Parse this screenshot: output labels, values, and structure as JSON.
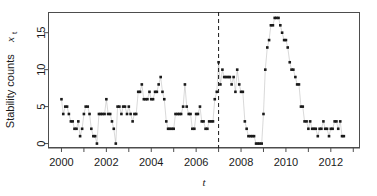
{
  "chart_data": {
    "type": "scatter",
    "title": "",
    "subtitle": "",
    "xlabel": "t",
    "ylabel": "Stability counts",
    "ylabel_sub": "t",
    "ylabel_var": "x",
    "xlim": [
      1999.4,
      2013.3
    ],
    "ylim": [
      -0.6,
      17.8
    ],
    "yticks": [
      0,
      5,
      10,
      15
    ],
    "ytick_labels": [
      "0",
      "5",
      "10",
      "15"
    ],
    "xticks": [
      2000,
      2001,
      2002,
      2003,
      2004,
      2005,
      2006,
      2007,
      2008,
      2009,
      2010,
      2011,
      2012,
      2013
    ],
    "xtick_labels": [
      "2000",
      "",
      "2002",
      "",
      "2004",
      "",
      "2006",
      "",
      "2008",
      "",
      "2010",
      "",
      "2012",
      ""
    ],
    "grid": false,
    "legend": "none",
    "point_color": "#1a1a1a",
    "line_color": "#9a9a9a",
    "annotation_line": {
      "type": "vertical-dashed",
      "x": 2007.0,
      "color": "#1a1a1a",
      "label": ""
    },
    "series": [
      {
        "name": "Stability counts",
        "x": [
          2000.0,
          2000.08,
          2000.17,
          2000.25,
          2000.33,
          2000.42,
          2000.5,
          2000.58,
          2000.67,
          2000.75,
          2000.83,
          2000.92,
          2001.0,
          2001.08,
          2001.17,
          2001.25,
          2001.33,
          2001.42,
          2001.5,
          2001.58,
          2001.67,
          2001.75,
          2001.83,
          2001.92,
          2002.0,
          2002.08,
          2002.17,
          2002.25,
          2002.33,
          2002.42,
          2002.5,
          2002.58,
          2002.67,
          2002.75,
          2002.83,
          2002.92,
          2003.0,
          2003.08,
          2003.17,
          2003.25,
          2003.33,
          2003.42,
          2003.5,
          2003.58,
          2003.67,
          2003.75,
          2003.83,
          2003.92,
          2004.0,
          2004.08,
          2004.17,
          2004.25,
          2004.33,
          2004.42,
          2004.5,
          2004.58,
          2004.67,
          2004.75,
          2004.83,
          2004.92,
          2005.0,
          2005.08,
          2005.17,
          2005.25,
          2005.33,
          2005.42,
          2005.5,
          2005.58,
          2005.67,
          2005.75,
          2005.83,
          2005.92,
          2006.0,
          2006.08,
          2006.17,
          2006.25,
          2006.33,
          2006.42,
          2006.5,
          2006.58,
          2006.67,
          2006.75,
          2006.83,
          2006.92,
          2007.0,
          2007.08,
          2007.17,
          2007.25,
          2007.33,
          2007.42,
          2007.5,
          2007.58,
          2007.67,
          2007.75,
          2007.83,
          2007.92,
          2008.0,
          2008.08,
          2008.17,
          2008.25,
          2008.33,
          2008.42,
          2008.5,
          2008.58,
          2008.67,
          2008.75,
          2008.83,
          2008.92,
          2009.0,
          2009.08,
          2009.17,
          2009.25,
          2009.33,
          2009.42,
          2009.5,
          2009.58,
          2009.67,
          2009.75,
          2009.83,
          2009.92,
          2010.0,
          2010.08,
          2010.17,
          2010.25,
          2010.33,
          2010.42,
          2010.5,
          2010.58,
          2010.67,
          2010.75,
          2010.83,
          2010.92,
          2011.0,
          2011.08,
          2011.17,
          2011.25,
          2011.33,
          2011.42,
          2011.5,
          2011.58,
          2011.67,
          2011.75,
          2011.83,
          2011.92,
          2012.0,
          2012.08,
          2012.17,
          2012.25,
          2012.33,
          2012.42,
          2012.5,
          2012.58
        ],
        "values": [
          6,
          4,
          5,
          5,
          4,
          3,
          3,
          2,
          2,
          3,
          1,
          2,
          4,
          5,
          5,
          4,
          2,
          1,
          1,
          0,
          4,
          4,
          4,
          4,
          6,
          4,
          4,
          3,
          2,
          0,
          5,
          5,
          4,
          5,
          5,
          4,
          5,
          4,
          3,
          4,
          4,
          7,
          7,
          8,
          6,
          6,
          6,
          7,
          6,
          6,
          7,
          7,
          8,
          9,
          7,
          6,
          3,
          2,
          2,
          2,
          2,
          4,
          4,
          4,
          4,
          5,
          8,
          5,
          4,
          4,
          2,
          2,
          4,
          4,
          5,
          3,
          3,
          2,
          2,
          3,
          3,
          3,
          6,
          7,
          11,
          8,
          10,
          9,
          9,
          9,
          9,
          8,
          9,
          7,
          10,
          8,
          7,
          7,
          3,
          2,
          1,
          1,
          1,
          1,
          0,
          0,
          0,
          0,
          4,
          10,
          13,
          14,
          16,
          16,
          17,
          17,
          17,
          16,
          15,
          14,
          14,
          13,
          11,
          10,
          10,
          9,
          8,
          8,
          5,
          5,
          3,
          3,
          2,
          3,
          2,
          2,
          2,
          1,
          2,
          2,
          3,
          2,
          2,
          1,
          2,
          2,
          3,
          3,
          2,
          3,
          1,
          1
        ]
      }
    ]
  },
  "axes": {
    "plot_left": 48,
    "plot_right": 360,
    "plot_top": 12,
    "plot_bottom": 148
  }
}
